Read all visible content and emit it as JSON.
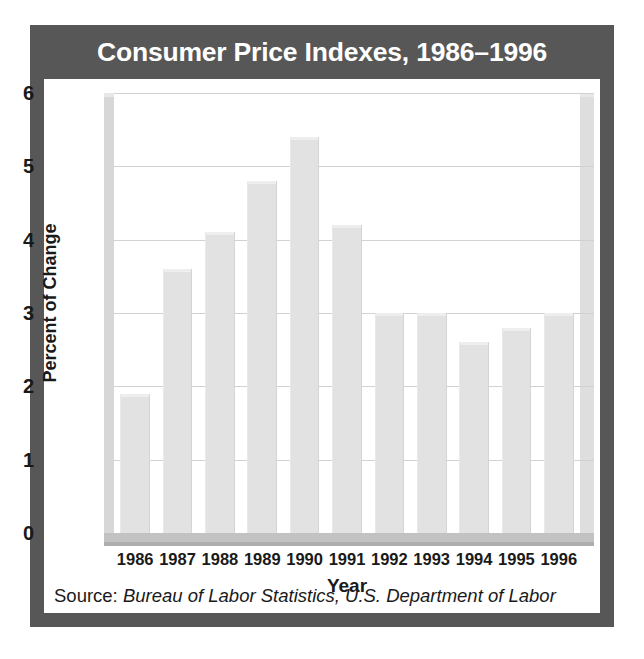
{
  "title": "Consumer Price Indexes, 1986–1996",
  "source": {
    "prefix": "Source: ",
    "cited": "Bureau of Labor Statistics, U.S. Department of Labor"
  },
  "colors": {
    "frame": "#575757",
    "title_text": "#ffffff",
    "plot_background": "#ffffff",
    "bar_fill": "#e2e2e2",
    "gridline": "#d2d2d2",
    "floor": "#c2c2c2",
    "axis_text": "#1a1a1a"
  },
  "chart_data": {
    "type": "bar",
    "title": "Consumer Price Indexes, 1986–1996",
    "xlabel": "Year",
    "ylabel": "Percent of Change",
    "categories": [
      "1986",
      "1987",
      "1988",
      "1989",
      "1990",
      "1991",
      "1992",
      "1993",
      "1994",
      "1995",
      "1996"
    ],
    "values": [
      1.9,
      3.6,
      4.1,
      4.8,
      5.4,
      4.2,
      3.0,
      3.0,
      2.6,
      2.8,
      3.0
    ],
    "ylim": [
      0,
      6
    ],
    "yticks": [
      6,
      5,
      4,
      3,
      2,
      1,
      0
    ],
    "ytick_labels": [
      "6",
      "5",
      "4",
      "3",
      "2",
      "1",
      "0"
    ],
    "grid": true,
    "legend": false,
    "legend_position": "none",
    "series": [
      {
        "name": "Percent of Change",
        "values": [
          1.9,
          3.6,
          4.1,
          4.8,
          5.4,
          4.2,
          3.0,
          3.0,
          2.6,
          2.8,
          3.0
        ]
      }
    ]
  }
}
